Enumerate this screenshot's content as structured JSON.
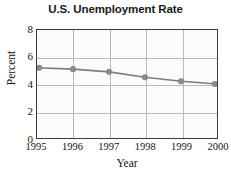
{
  "chart_data": {
    "type": "line",
    "title": "U.S. Unemployment Rate",
    "xlabel": "Year",
    "ylabel": "Percent",
    "categories": [
      "1995",
      "1996",
      "1997",
      "1998",
      "1999",
      "2000"
    ],
    "x": [
      1995,
      1996,
      1997,
      1998,
      1999,
      2000
    ],
    "values": [
      5.2,
      5.1,
      4.9,
      4.5,
      4.2,
      4.0
    ],
    "series": [
      {
        "name": "U.S. Unemployment Rate",
        "values": [
          5.2,
          5.1,
          4.9,
          4.5,
          4.2,
          4.0
        ]
      }
    ],
    "ylim": [
      0,
      8
    ],
    "xlim": [
      1995,
      2000
    ],
    "ytick_labels": [
      "0",
      "2",
      "4",
      "6",
      "8"
    ],
    "yticks": [
      0,
      2,
      4,
      6,
      8
    ],
    "xtick_labels": [
      "1995",
      "1996",
      "1997",
      "1998",
      "1999",
      "2000"
    ],
    "grid": true,
    "legend": false,
    "legend_position": "none",
    "marker": "circle",
    "colors": {
      "line": "#7d7d7d",
      "marker": "#8a8a8a",
      "grid": "#b9b9b9",
      "axis": "#3a3a3a",
      "plot_background": "#fbfbfb",
      "figure_background": "#ffffff",
      "text": "#141414",
      "title_text": "#1a1a1a"
    }
  }
}
